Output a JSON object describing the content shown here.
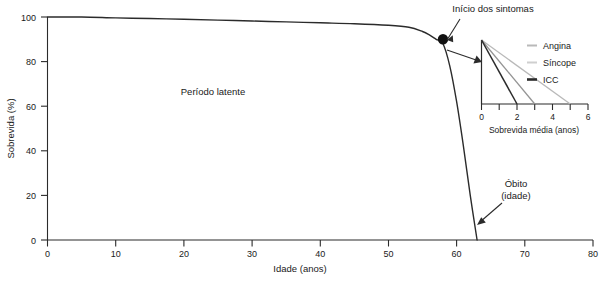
{
  "chart_data": {
    "type": "line",
    "title": "",
    "xlabel": "Idade (anos)",
    "ylabel": "Sobrevida (%)",
    "xlim": [
      0,
      80
    ],
    "ylim": [
      0,
      100
    ],
    "xticks": [
      "0",
      "10",
      "20",
      "30",
      "40",
      "50",
      "60",
      "70",
      "80"
    ],
    "yticks": [
      "0",
      "20",
      "40",
      "60",
      "80",
      "100"
    ],
    "grid": false,
    "legend_position": "none",
    "series": [
      {
        "name": "Sobrevida na estenose aortica",
        "x": [
          0,
          5,
          10,
          15,
          20,
          25,
          30,
          35,
          40,
          45,
          50,
          53,
          55,
          56,
          57,
          58,
          59,
          60,
          61,
          62,
          63
        ],
        "values": [
          100,
          100,
          99.6,
          99.3,
          99,
          98.6,
          98.2,
          97.8,
          97.4,
          97,
          96.3,
          95.4,
          93.5,
          92,
          90,
          88,
          78,
          62,
          42,
          20,
          0
        ]
      }
    ],
    "annotations": [
      {
        "label": "Periodo latente",
        "text": "Período latente",
        "x": 24,
        "y": 72
      },
      {
        "label": "Inicio dos sintomas",
        "text": "Início dos sintomas",
        "x": 58,
        "y": 90
      },
      {
        "label": "Obito",
        "text": "Óbito",
        "x": 63,
        "y": 13
      },
      {
        "label": "Obito idade",
        "text": "(idade)",
        "x": 63,
        "y": 7
      }
    ],
    "symptom_onset_point": {
      "x": 58,
      "y": 90
    },
    "death_point": {
      "x": 63,
      "y": 0
    }
  },
  "inset_chart": {
    "type": "line",
    "title": "",
    "xlabel": "Sobrevida média (anos)",
    "ylabel": "",
    "xlim": [
      0,
      6
    ],
    "ylim": [
      0,
      100
    ],
    "xticks": [
      "0",
      "1",
      "2",
      "3",
      "4",
      "5",
      "6"
    ],
    "xtick_labeled": [
      "0",
      "2",
      "4",
      "6"
    ],
    "grid": false,
    "legend_position": "right",
    "series": [
      {
        "name": "Angina",
        "x": [
          0,
          5
        ],
        "values": [
          100,
          0
        ],
        "color": "#b9b9b9"
      },
      {
        "name": "Síncope",
        "x": [
          0,
          3
        ],
        "values": [
          100,
          0
        ],
        "color": "#949494"
      },
      {
        "name": "ICC",
        "x": [
          0,
          2
        ],
        "values": [
          100,
          0
        ],
        "color": "#2b2b2b"
      }
    ]
  },
  "axes": {
    "y_title": "Sobrevida (%)",
    "x_title": "Idade (anos)",
    "y_ticks": [
      "100",
      "80",
      "60",
      "40",
      "20",
      "0"
    ],
    "x_ticks": [
      "0",
      "10",
      "20",
      "30",
      "40",
      "50",
      "60",
      "70",
      "80"
    ]
  },
  "inset_axes": {
    "x_title": "Sobrevida média (anos)",
    "x_ticks": [
      "0",
      "2",
      "4",
      "6"
    ]
  },
  "legend": {
    "items": [
      {
        "label": "Angina",
        "color": "#b9b9b9"
      },
      {
        "label": "Síncope",
        "color": "#949494"
      },
      {
        "label": "ICC",
        "color": "#2b2b2b"
      }
    ]
  },
  "labels": {
    "latent_period": "Período latente",
    "symptom_onset": "Início dos sintomas",
    "death_line1": "Óbito",
    "death_line2": "(idade)"
  },
  "colors": {
    "ink": "#2b2b2b",
    "angina": "#b9b9b9",
    "sincope": "#949494",
    "icc": "#2b2b2b",
    "background": "#ffffff"
  }
}
